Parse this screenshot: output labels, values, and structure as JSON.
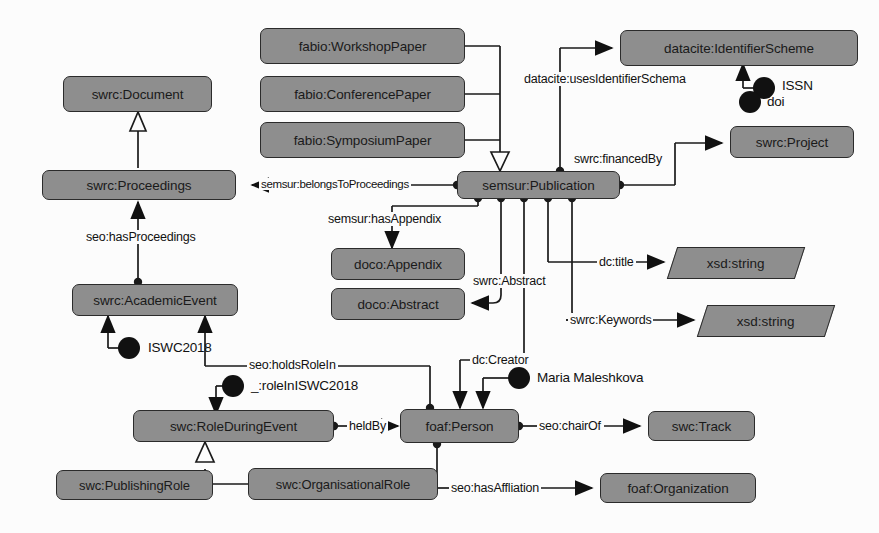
{
  "diagram": {
    "colors": {
      "node_fill": "#8e8e8e",
      "node_stroke": "#2b2b2b",
      "individual_fill": "#111111",
      "background": "#fcfcfc",
      "text": "#1a1a1a"
    },
    "classes": [
      {
        "id": "swrc-document",
        "label": "swrc:Document"
      },
      {
        "id": "swrc-proceedings",
        "label": "swrc:Proceedings"
      },
      {
        "id": "swrc-academicevent",
        "label": "swrc:AcademicEvent"
      },
      {
        "id": "fabio-workshoppaper",
        "label": "fabio:WorkshopPaper"
      },
      {
        "id": "fabio-conferencepaper",
        "label": "fabio:ConferencePaper"
      },
      {
        "id": "fabio-symposiumpaper",
        "label": "fabio:SymposiumPaper"
      },
      {
        "id": "semsur-publication",
        "label": "semsur:Publication"
      },
      {
        "id": "datacite-identifierscheme",
        "label": "datacite:IdentifierScheme"
      },
      {
        "id": "swrc-project",
        "label": "swrc:Project"
      },
      {
        "id": "doco-appendix",
        "label": "doco:Appendix"
      },
      {
        "id": "doco-abstract",
        "label": "doco:Abstract"
      },
      {
        "id": "swc-roleduringevent",
        "label": "swc:RoleDuringEvent"
      },
      {
        "id": "swc-publishingrole",
        "label": "swc:PublishingRole"
      },
      {
        "id": "swc-organisationalrole",
        "label": "swc:OrganisationalRole"
      },
      {
        "id": "foaf-person",
        "label": "foaf:Person"
      },
      {
        "id": "swc-track",
        "label": "swc:Track"
      },
      {
        "id": "foaf-organization",
        "label": "foaf:Organization"
      }
    ],
    "datatypes": [
      {
        "id": "xsd-string-title",
        "label": "xsd:string"
      },
      {
        "id": "xsd-string-keywords",
        "label": "xsd:string"
      }
    ],
    "individuals": [
      {
        "id": "issn",
        "label": "ISSN"
      },
      {
        "id": "doi",
        "label": "doi"
      },
      {
        "id": "iswc2018",
        "label": "ISWC2018"
      },
      {
        "id": "role-in-iswc2018",
        "label": "_:roleInISWC2018"
      },
      {
        "id": "maria-maleshkova",
        "label": "Maria Maleshkova"
      }
    ],
    "relations": [
      {
        "id": "belongs-to-proceedings",
        "label": "semsur:belongsToProceedings",
        "from": "semsur-publication",
        "to": "swrc-proceedings"
      },
      {
        "id": "has-proceedings",
        "label": "seo:hasProceedings",
        "from": "swrc-academicevent",
        "to": "swrc-proceedings"
      },
      {
        "id": "has-appendix",
        "label": "semsur:hasAppendix",
        "from": "semsur-publication",
        "to": "doco-appendix"
      },
      {
        "id": "abstract",
        "label": "swrc:Abstract",
        "from": "semsur-publication",
        "to": "doco-abstract"
      },
      {
        "id": "uses-identifier-schema",
        "label": "datacite:usesIdentifierSchema",
        "from": "semsur-publication",
        "to": "datacite-identifierscheme"
      },
      {
        "id": "financed-by",
        "label": "swrc:financedBy",
        "from": "semsur-publication",
        "to": "swrc-project"
      },
      {
        "id": "title",
        "label": "dc:title",
        "from": "semsur-publication",
        "to": "xsd-string-title"
      },
      {
        "id": "keywords",
        "label": "swrc:Keywords",
        "from": "semsur-publication",
        "to": "xsd-string-keywords"
      },
      {
        "id": "creator",
        "label": "dc:Creator",
        "from": "semsur-publication",
        "to": "foaf-person"
      },
      {
        "id": "holds-role-in",
        "label": "seo:holdsRoleIn",
        "from": "foaf-person",
        "to": "swrc-academicevent"
      },
      {
        "id": "held-by",
        "label": "heldBy",
        "from": "swc-roleduringevent",
        "to": "foaf-person"
      },
      {
        "id": "chair-of",
        "label": "seo:chairOf",
        "from": "foaf-person",
        "to": "swc-track"
      },
      {
        "id": "has-affliation",
        "label": "seo:hasAffliation",
        "from": "foaf-person",
        "to": "foaf-organization"
      }
    ],
    "generalizations": [
      {
        "id": "gen-proceedings-document",
        "sub": "swrc-proceedings",
        "super": "swrc-document"
      },
      {
        "id": "gen-papers-publication",
        "sub": "fabio-papers",
        "super": "semsur-publication"
      },
      {
        "id": "gen-roles-roleduringevent",
        "sub": "swc-roles",
        "super": "swc-roleduringevent"
      }
    ]
  }
}
